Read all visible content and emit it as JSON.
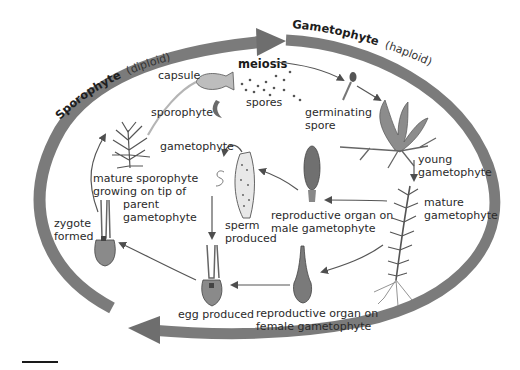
{
  "diagram": {
    "phases": {
      "sporophyte": {
        "name": "Sporophyte",
        "ploidy": "(diploid)"
      },
      "gametophyte": {
        "name": "Gametophyte",
        "ploidy": "(haploid)"
      }
    },
    "labels": {
      "meiosis": "meiosis",
      "capsule": "capsule",
      "spores": "spores",
      "sporophyte": "sporophyte",
      "gametophyte": "gametophyte",
      "germinating_1": "germinating",
      "germinating_2": "spore",
      "young_1": "young",
      "young_2": "gametophyte",
      "mature_1": "mature",
      "mature_2": "gametophyte",
      "male_1": "reproductive organ on",
      "male_2": "male gametophyte",
      "female_1": "reproductive organ on",
      "female_2": "female gametophyte",
      "sperm_1": "sperm",
      "sperm_2": "produced",
      "egg": "egg produced",
      "zygote_1": "zygote",
      "zygote_2": "formed",
      "matsporo_1": "mature sporophyte",
      "matsporo_2": "growing on tip of",
      "matsporo_3": "parent",
      "matsporo_4": "gametophyte"
    },
    "colors": {
      "ring": "#7a7a7a",
      "ring_light": "#9a9a9a",
      "arrow": "#5a5a5a",
      "text": "#2a2a2a"
    }
  }
}
